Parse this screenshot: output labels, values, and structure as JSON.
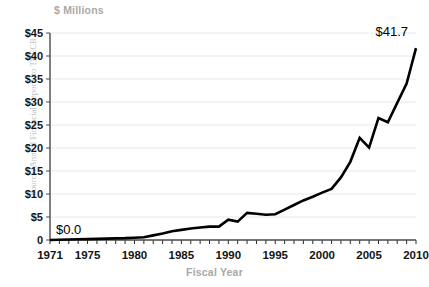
{
  "chart_data": {
    "type": "line",
    "title": "",
    "subtitle": "",
    "xlabel": "Fiscal Year",
    "ylabel": "$ Millions",
    "y_unit_caption": "$ Millions",
    "source_note": "Source: Annual Financial Reports to THECB",
    "grid": true,
    "legend": "none",
    "xlim": [
      1971,
      2010
    ],
    "ylim": [
      0,
      45
    ],
    "ytick_labels": [
      "$45",
      "$40",
      "$35",
      "$30",
      "$25",
      "$20",
      "$15",
      "$10",
      "$5",
      "0"
    ],
    "ytick_values": [
      45,
      40,
      35,
      30,
      25,
      20,
      15,
      10,
      5,
      0
    ],
    "xtick_labels": [
      "1971",
      "1975",
      "1980",
      "1985",
      "1990",
      "1995",
      "2000",
      "2005",
      "2010"
    ],
    "xtick_values": [
      1971,
      1975,
      1980,
      1985,
      1990,
      1995,
      2000,
      2005,
      2010
    ],
    "x": [
      1971,
      1972,
      1973,
      1974,
      1975,
      1976,
      1977,
      1978,
      1979,
      1980,
      1981,
      1982,
      1983,
      1984,
      1985,
      1986,
      1987,
      1988,
      1989,
      1990,
      1991,
      1992,
      1993,
      1994,
      1995,
      1996,
      1997,
      1998,
      1999,
      2000,
      2001,
      2002,
      2003,
      2004,
      2005,
      2006,
      2007,
      2008,
      2009,
      2010
    ],
    "values": [
      0.0,
      0.05,
      0.1,
      0.15,
      0.2,
      0.25,
      0.3,
      0.35,
      0.4,
      0.5,
      0.6,
      1.0,
      1.4,
      1.9,
      2.2,
      2.5,
      2.7,
      2.9,
      2.9,
      4.4,
      4.0,
      5.9,
      5.7,
      5.5,
      5.6,
      6.6,
      7.6,
      8.6,
      9.4,
      10.3,
      11.1,
      13.6,
      17.0,
      22.2,
      20.1,
      26.5,
      25.6,
      29.8,
      34.0,
      41.7
    ],
    "series": [
      {
        "name": "Annual amount",
        "values": [
          0.0,
          0.05,
          0.1,
          0.15,
          0.2,
          0.25,
          0.3,
          0.35,
          0.4,
          0.5,
          0.6,
          1.0,
          1.4,
          1.9,
          2.2,
          2.5,
          2.7,
          2.9,
          2.9,
          4.4,
          4.0,
          5.9,
          5.7,
          5.5,
          5.6,
          6.6,
          7.6,
          8.6,
          9.4,
          10.3,
          11.1,
          13.6,
          17.0,
          22.2,
          20.1,
          26.5,
          25.6,
          29.8,
          34.0,
          41.7
        ],
        "color": "#000000"
      }
    ],
    "annotations": [
      {
        "label": "$0.0",
        "x": 1971,
        "y": 0.0
      },
      {
        "label": "$41.7",
        "x": 2010,
        "y": 41.7
      }
    ],
    "colors": {
      "line": "#000000",
      "grid": "#e9e9e9",
      "axis": "#4a4a4a",
      "tick_text": "#141414",
      "caption_text": "#a8a8a8",
      "source_text": "#bdbdbd",
      "background": "#ffffff"
    }
  }
}
